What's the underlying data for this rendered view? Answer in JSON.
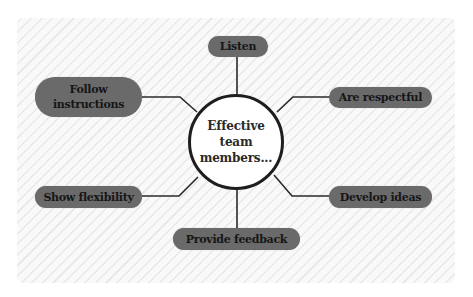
{
  "diagram": {
    "type": "mind-map",
    "center": {
      "label": "Effective\nteam\nmembers..."
    },
    "nodes": [
      {
        "id": "listen",
        "label": "Listen",
        "position": "top"
      },
      {
        "id": "follow-instructions",
        "label": "Follow\ninstructions",
        "position": "upper-left"
      },
      {
        "id": "are-respectful",
        "label": "Are respectful",
        "position": "upper-right"
      },
      {
        "id": "show-flexibility",
        "label": "Show flexibility",
        "position": "lower-left"
      },
      {
        "id": "develop-ideas",
        "label": "Develop ideas",
        "position": "lower-right"
      },
      {
        "id": "provide-feedback",
        "label": "Provide feedback",
        "position": "bottom"
      }
    ],
    "colors": {
      "pill_fill": "#6a6a6a",
      "pill_text": "#161616",
      "center_border": "#1e1e1e",
      "center_fill": "#ffffff",
      "connector": "#2a2a2a",
      "panel_bg": "#f8f8f8",
      "panel_stripe": "#e9e9e9"
    }
  }
}
